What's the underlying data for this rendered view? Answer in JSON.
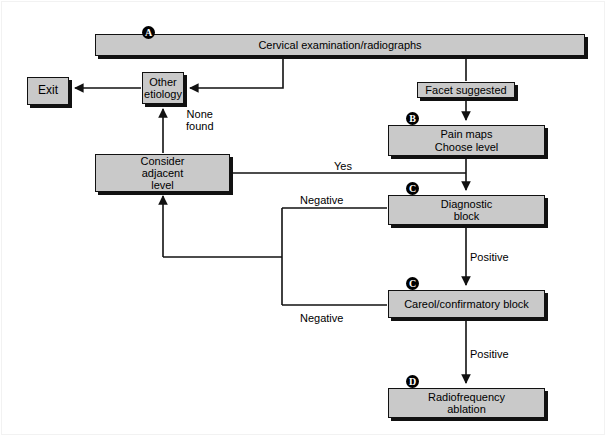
{
  "diagram": {
    "background_color": "#ffffff",
    "node_fill": "#c9c9c9",
    "node_stroke": "#111111",
    "line_color": "#111111",
    "nodes": [
      {
        "id": "cervical-exam",
        "label": "Cervical examination/radiographs",
        "marker": "A",
        "x": 95,
        "y": 34,
        "w": 490,
        "h": 22,
        "font_size": 11
      },
      {
        "id": "exit",
        "label": "Exit",
        "marker": "",
        "x": 27,
        "y": 77,
        "w": 42,
        "h": 28,
        "font_size": 12
      },
      {
        "id": "other-etiology",
        "label": "Other\netiology",
        "marker": "",
        "x": 142,
        "y": 72,
        "w": 42,
        "h": 32,
        "font_size": 11
      },
      {
        "id": "facet-suggested",
        "label": "Facet suggested",
        "marker": "",
        "x": 417,
        "y": 82,
        "w": 98,
        "h": 16,
        "font_size": 11
      },
      {
        "id": "pain-maps",
        "label": "Pain maps\nChoose level",
        "marker": "B",
        "x": 388,
        "y": 125,
        "w": 157,
        "h": 31,
        "font_size": 11
      },
      {
        "id": "consider-adjacent",
        "label": "Consider\nadjacent\nlevel",
        "marker": "",
        "x": 95,
        "y": 154,
        "w": 135,
        "h": 38,
        "font_size": 11
      },
      {
        "id": "diagnostic-block",
        "label": "Diagnostic\nblock",
        "marker": "C",
        "x": 388,
        "y": 195,
        "w": 157,
        "h": 30,
        "font_size": 11
      },
      {
        "id": "careol-block",
        "label": "Careol/confirmatory block",
        "marker": "C",
        "x": 388,
        "y": 290,
        "w": 157,
        "h": 28,
        "font_size": 11
      },
      {
        "id": "radiofrequency",
        "label": "Radiofrequency\nablation",
        "marker": "D",
        "x": 388,
        "y": 388,
        "w": 157,
        "h": 30,
        "font_size": 11
      }
    ],
    "markers": [
      {
        "id": "marker-a",
        "letter": "A",
        "x": 142,
        "y": 26
      },
      {
        "id": "marker-b",
        "letter": "B",
        "x": 406,
        "y": 112
      },
      {
        "id": "marker-c1",
        "letter": "C",
        "x": 406,
        "y": 182
      },
      {
        "id": "marker-c2",
        "letter": "C",
        "x": 406,
        "y": 277
      },
      {
        "id": "marker-d",
        "letter": "D",
        "x": 406,
        "y": 375
      }
    ],
    "edge_labels": [
      {
        "id": "label-none-found",
        "text": "None\nfound",
        "x": 186,
        "y": 108
      },
      {
        "id": "label-yes",
        "text": "Yes",
        "x": 334,
        "y": 160
      },
      {
        "id": "label-negative-upper",
        "text": "Negative",
        "x": 300,
        "y": 194
      },
      {
        "id": "label-positive-upper",
        "text": "Positive",
        "x": 470,
        "y": 251
      },
      {
        "id": "label-negative-lower",
        "text": "Negative",
        "x": 300,
        "y": 312
      },
      {
        "id": "label-positive-lower",
        "text": "Positive",
        "x": 470,
        "y": 348
      }
    ],
    "connections": [
      {
        "id": "conn-exam-to-other",
        "from": "cervical-exam",
        "to": "other-etiology",
        "label": ""
      },
      {
        "id": "conn-other-to-exit",
        "from": "other-etiology",
        "to": "exit",
        "label": ""
      },
      {
        "id": "conn-exam-to-facet",
        "from": "cervical-exam",
        "to": "facet-suggested",
        "label": ""
      },
      {
        "id": "conn-facet-to-painmaps",
        "from": "facet-suggested",
        "to": "pain-maps",
        "label": ""
      },
      {
        "id": "conn-painmaps-to-diagnostic",
        "from": "pain-maps",
        "to": "diagnostic-block",
        "label": ""
      },
      {
        "id": "conn-consider-to-diagnostic",
        "from": "consider-adjacent",
        "to": "diagnostic-block",
        "label": "Yes"
      },
      {
        "id": "conn-consider-to-other",
        "from": "consider-adjacent",
        "to": "other-etiology",
        "label": "None found"
      },
      {
        "id": "conn-diagnostic-negative",
        "from": "diagnostic-block",
        "to": "consider-adjacent",
        "label": "Negative"
      },
      {
        "id": "conn-diagnostic-positive",
        "from": "diagnostic-block",
        "to": "careol-block",
        "label": "Positive"
      },
      {
        "id": "conn-careol-negative",
        "from": "careol-block",
        "to": "consider-adjacent",
        "label": "Negative"
      },
      {
        "id": "conn-careol-positive",
        "from": "careol-block",
        "to": "radiofrequency",
        "label": "Positive"
      }
    ]
  }
}
